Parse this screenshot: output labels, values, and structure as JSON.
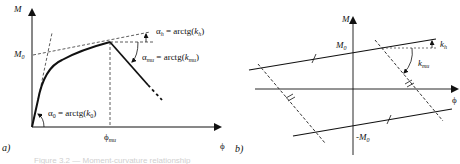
{
  "figure": {
    "panel_a": {
      "label": "a)",
      "axis_y": "M",
      "axis_x": "ϕ",
      "y_mark": "M0",
      "x_mark": "ϕmu",
      "annotations": {
        "alpha_h": "αh = arctg(kh)",
        "alpha_mu": "αmu = arctg(kmu)",
        "alpha_0": "α0 = arctg(k0)"
      }
    },
    "panel_b": {
      "label": "b)",
      "axis_y": "M",
      "axis_x": "ϕ",
      "upper_mark": "M0",
      "lower_mark": "-M0",
      "annotations": {
        "kh": "kh",
        "kmu": "kmu"
      }
    },
    "caption": "Figure 3.2 — Moment-curvature relationship"
  },
  "colors": {
    "line": "#111111",
    "dashed": "#333333",
    "background": "#ffffff"
  }
}
